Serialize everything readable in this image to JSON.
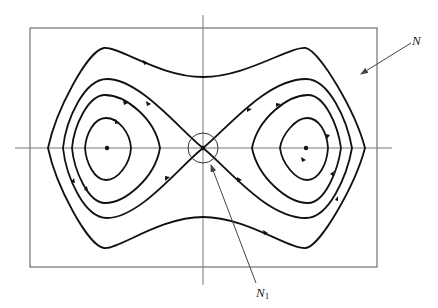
{
  "figure": {
    "labels": {
      "n": "N",
      "n1_base": "N",
      "n1_sub": "1"
    },
    "colors": {
      "orbit": "#111111",
      "axis": "#777777",
      "box": "#555555",
      "pointer": "#444444"
    },
    "elements": {
      "isolating_box": "N",
      "saddle_neighborhood": "N1",
      "equilibria": [
        "left-center",
        "saddle",
        "right-center"
      ],
      "orbits": [
        "outer-periodic-orbit",
        "homoclinic-separatrix",
        "inner-periodic-orbit-left",
        "inner-periodic-orbit-right",
        "innermost-periodic-orbit-left",
        "innermost-periodic-orbit-right",
        "mid-periodic-orbit-left",
        "mid-periodic-orbit-right"
      ]
    }
  }
}
